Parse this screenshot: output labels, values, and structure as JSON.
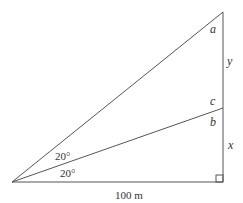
{
  "diagram": {
    "type": "right-triangle-angles",
    "labels": {
      "a": "a",
      "b": "b",
      "c": "c",
      "x": "x",
      "y": "y",
      "angle_upper": "20°",
      "angle_lower": "20°",
      "base": "100 m"
    },
    "points": {
      "apex": [
        12,
        182
      ],
      "right_corner": [
        223,
        182
      ],
      "top": [
        223,
        12
      ],
      "middle": [
        223,
        108
      ]
    },
    "colors": {
      "line": "#555555",
      "text": "#333333"
    }
  }
}
